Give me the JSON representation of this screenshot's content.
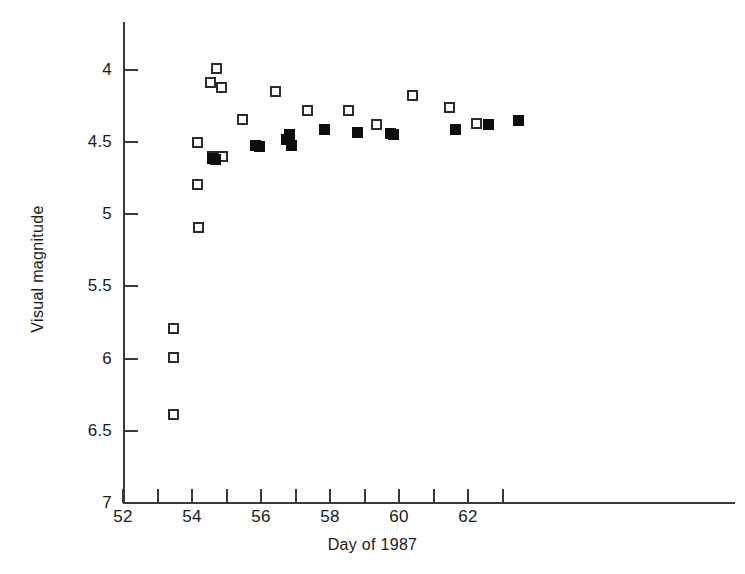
{
  "chart_data": {
    "type": "scatter",
    "title": "",
    "xlabel": "Day of 1987",
    "ylabel": "Visual magnitude",
    "xlim": [
      52,
      63.75
    ],
    "ylim": [
      7,
      4
    ],
    "y_inverted": true,
    "grid": false,
    "legend_position": "none",
    "x_ticks_major": [
      52,
      54,
      56,
      58,
      60,
      62
    ],
    "x_ticks_minor": [
      53,
      55,
      57,
      59,
      61,
      63
    ],
    "y_ticks_major": [
      4,
      4.5,
      5,
      5.5,
      6,
      6.5,
      7
    ],
    "series": [
      {
        "name": "open-square",
        "marker": "open square",
        "points": [
          {
            "x": 53.45,
            "y": 5.79
          },
          {
            "x": 53.45,
            "y": 5.99
          },
          {
            "x": 53.45,
            "y": 6.39
          },
          {
            "x": 54.15,
            "y": 4.5
          },
          {
            "x": 54.17,
            "y": 4.79
          },
          {
            "x": 54.2,
            "y": 5.09
          },
          {
            "x": 54.55,
            "y": 4.09
          },
          {
            "x": 54.6,
            "y": 4.6
          },
          {
            "x": 54.7,
            "y": 4.6
          },
          {
            "x": 54.8,
            "y": 4.6
          },
          {
            "x": 54.72,
            "y": 3.99
          },
          {
            "x": 54.85,
            "y": 4.12
          },
          {
            "x": 54.88,
            "y": 4.6
          },
          {
            "x": 55.45,
            "y": 4.34
          },
          {
            "x": 56.42,
            "y": 4.15
          },
          {
            "x": 57.35,
            "y": 4.28
          },
          {
            "x": 58.55,
            "y": 4.28
          },
          {
            "x": 59.35,
            "y": 4.38
          },
          {
            "x": 60.4,
            "y": 4.18
          },
          {
            "x": 61.45,
            "y": 4.26
          },
          {
            "x": 62.25,
            "y": 4.37
          }
        ]
      },
      {
        "name": "filled-square",
        "marker": "filled square",
        "points": [
          {
            "x": 54.6,
            "y": 4.61
          },
          {
            "x": 54.68,
            "y": 4.62
          },
          {
            "x": 55.85,
            "y": 4.52
          },
          {
            "x": 55.95,
            "y": 4.53
          },
          {
            "x": 56.75,
            "y": 4.48
          },
          {
            "x": 56.82,
            "y": 4.45
          },
          {
            "x": 56.88,
            "y": 4.52
          },
          {
            "x": 57.85,
            "y": 4.41
          },
          {
            "x": 58.8,
            "y": 4.43
          },
          {
            "x": 59.75,
            "y": 4.44
          },
          {
            "x": 59.85,
            "y": 4.45
          },
          {
            "x": 61.65,
            "y": 4.41
          },
          {
            "x": 62.6,
            "y": 4.38
          },
          {
            "x": 63.45,
            "y": 4.35
          }
        ]
      }
    ]
  },
  "axes": {
    "y_title": "Visual magnitude",
    "x_title": "Day of 1987",
    "y_tick_labels": [
      "4",
      "4.5",
      "5",
      "5.5",
      "6",
      "6.5",
      "7"
    ],
    "x_tick_labels": [
      "52",
      "54",
      "56",
      "58",
      "60",
      "62"
    ]
  }
}
